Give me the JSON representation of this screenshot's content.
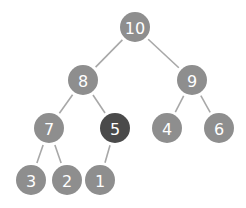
{
  "diagram": {
    "type": "binary-tree (max-heap)",
    "colors": {
      "node": "#8e8e8e",
      "highlight": "#4a4a4a",
      "edge": "#a8a8a8",
      "text": "#ffffff"
    },
    "nodes": [
      {
        "id": "n10",
        "label": "10",
        "x": 135,
        "y": 27,
        "highlight": false
      },
      {
        "id": "n8",
        "label": "8",
        "x": 83,
        "y": 80,
        "highlight": false
      },
      {
        "id": "n9",
        "label": "9",
        "x": 192,
        "y": 80,
        "highlight": false
      },
      {
        "id": "n7",
        "label": "7",
        "x": 49,
        "y": 128,
        "highlight": false
      },
      {
        "id": "n5",
        "label": "5",
        "x": 115,
        "y": 128,
        "highlight": true
      },
      {
        "id": "n4",
        "label": "4",
        "x": 167,
        "y": 128,
        "highlight": false
      },
      {
        "id": "n6",
        "label": "6",
        "x": 219,
        "y": 128,
        "highlight": false
      },
      {
        "id": "n3",
        "label": "3",
        "x": 31,
        "y": 180,
        "highlight": false
      },
      {
        "id": "n2",
        "label": "2",
        "x": 67,
        "y": 180,
        "highlight": false
      },
      {
        "id": "n1",
        "label": "1",
        "x": 100,
        "y": 180,
        "highlight": false
      }
    ],
    "edges": [
      [
        "n10",
        "n8"
      ],
      [
        "n10",
        "n9"
      ],
      [
        "n8",
        "n7"
      ],
      [
        "n8",
        "n5"
      ],
      [
        "n9",
        "n4"
      ],
      [
        "n9",
        "n6"
      ],
      [
        "n7",
        "n3"
      ],
      [
        "n7",
        "n2"
      ],
      [
        "n5",
        "n1"
      ]
    ]
  }
}
